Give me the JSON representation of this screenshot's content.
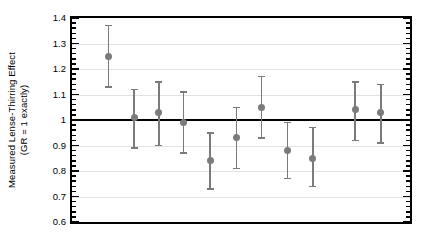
{
  "chart_data": {
    "type": "scatter",
    "title": "",
    "xlabel": "",
    "ylabel": "Measured Lense-Thirring Effect (GR = 1 exactly)",
    "ylabel_line1": "Measured Lense-Thirring Effect",
    "ylabel_line2": "(GR = 1 exactly)",
    "ylim": [
      0.6,
      1.4
    ],
    "ytick_labels": [
      "1.4",
      "1.3",
      "1.2",
      "1.1",
      "1",
      "0.9",
      "0.8",
      "0.7",
      "0.6"
    ],
    "ytick_values": [
      1.4,
      1.3,
      1.2,
      1.1,
      1.0,
      0.9,
      0.8,
      0.7,
      0.6
    ],
    "minor_tick_step": 0.02,
    "grid": true,
    "legend": "none",
    "reference_line": {
      "value": 1.0,
      "label": "GR = 1 exactly",
      "color": "#000000"
    },
    "marker_color": "#7b7b7b",
    "errorbar_color": "#7b7b7b",
    "gridline_color": "#e2e2e2",
    "axis_color": "#000000",
    "x": [
      1,
      2,
      3,
      4,
      5,
      6,
      7,
      8,
      9,
      10,
      11
    ],
    "series": [
      {
        "name": "Measured Lense-Thirring Effect",
        "values": [
          1.25,
          1.01,
          1.03,
          0.99,
          0.84,
          0.93,
          1.05,
          0.88,
          0.85,
          1.04,
          1.03
        ],
        "err_low": [
          1.13,
          0.89,
          0.9,
          0.87,
          0.73,
          0.81,
          0.93,
          0.77,
          0.74,
          0.92,
          0.91
        ],
        "err_high": [
          1.37,
          1.12,
          1.15,
          1.11,
          0.95,
          1.05,
          1.17,
          0.99,
          0.97,
          1.15,
          1.14
        ]
      }
    ],
    "points": [
      {
        "index": 1,
        "x_frac": 0.108,
        "value": 1.25,
        "low": 1.13,
        "high": 1.37
      },
      {
        "index": 2,
        "x_frac": 0.184,
        "value": 1.01,
        "low": 0.89,
        "high": 1.12
      },
      {
        "index": 3,
        "x_frac": 0.257,
        "value": 1.03,
        "low": 0.9,
        "high": 1.15
      },
      {
        "index": 4,
        "x_frac": 0.33,
        "value": 0.99,
        "low": 0.87,
        "high": 1.11
      },
      {
        "index": 5,
        "x_frac": 0.409,
        "value": 0.84,
        "low": 0.73,
        "high": 0.95
      },
      {
        "index": 6,
        "x_frac": 0.487,
        "value": 0.93,
        "low": 0.81,
        "high": 1.05
      },
      {
        "index": 7,
        "x_frac": 0.561,
        "value": 1.05,
        "low": 0.93,
        "high": 1.17
      },
      {
        "index": 8,
        "x_frac": 0.637,
        "value": 0.88,
        "low": 0.77,
        "high": 0.99
      },
      {
        "index": 9,
        "x_frac": 0.713,
        "value": 0.85,
        "low": 0.74,
        "high": 0.97
      },
      {
        "index": 10,
        "x_frac": 0.838,
        "value": 1.04,
        "low": 0.92,
        "high": 1.15
      },
      {
        "index": 11,
        "x_frac": 0.914,
        "value": 1.03,
        "low": 0.91,
        "high": 1.14
      }
    ]
  }
}
